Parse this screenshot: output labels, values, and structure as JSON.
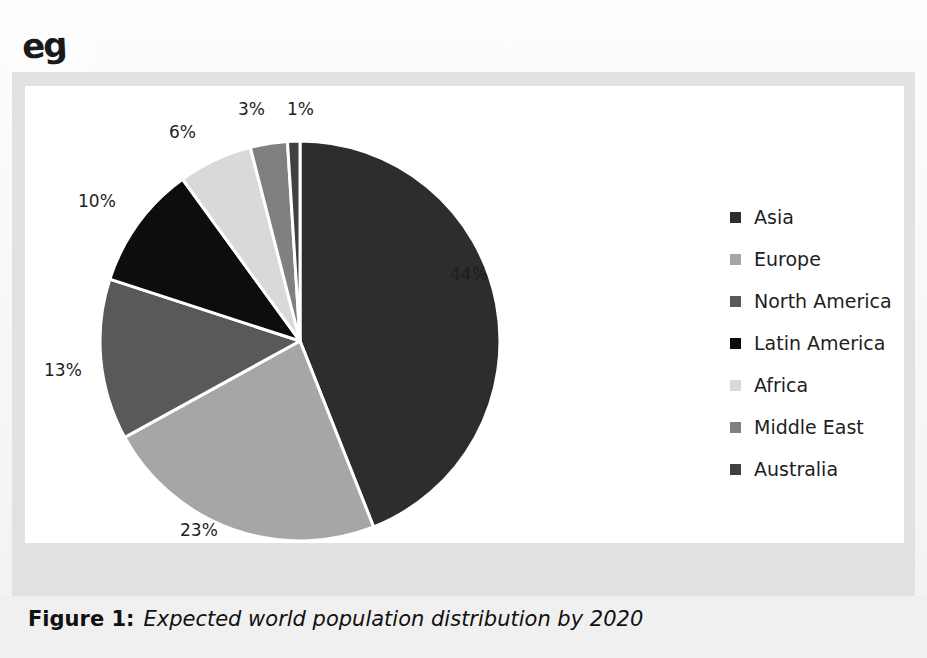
{
  "page": {
    "ghost_watermark": "population",
    "annotation_mark": "eg"
  },
  "caption": {
    "figure_number": "Figure 1:",
    "text": "Expected world population distribution by 2020"
  },
  "legend": {
    "items": [
      {
        "label": "Asia",
        "color": "#2d2d2d"
      },
      {
        "label": "Europe",
        "color": "#a6a6a6"
      },
      {
        "label": "North America",
        "color": "#595959"
      },
      {
        "label": "Latin America",
        "color": "#0d0d0d"
      },
      {
        "label": "Africa",
        "color": "#d9d9d9"
      },
      {
        "label": "Middle East",
        "color": "#808080"
      },
      {
        "label": "Australia",
        "color": "#404040"
      }
    ]
  },
  "labels": [
    {
      "text": "44%"
    },
    {
      "text": "23%"
    },
    {
      "text": "13%"
    },
    {
      "text": "10%"
    },
    {
      "text": "6%"
    },
    {
      "text": "3%"
    },
    {
      "text": "1%"
    }
  ],
  "chart_data": {
    "type": "pie",
    "title": "Expected world population distribution by 2020",
    "xlabel": "",
    "ylabel": "",
    "categories": [
      "Asia",
      "Europe",
      "North America",
      "Latin America",
      "Africa",
      "Middle East",
      "Australia"
    ],
    "values": [
      44,
      23,
      13,
      10,
      6,
      3,
      1
    ],
    "value_labels": [
      "44%",
      "23%",
      "13%",
      "10%",
      "6%",
      "3%",
      "1%"
    ],
    "colors": [
      "#2d2d2d",
      "#a6a6a6",
      "#595959",
      "#0d0d0d",
      "#d9d9d9",
      "#808080",
      "#404040"
    ],
    "units": "percent",
    "start_angle_deg": 0,
    "direction": "clockwise",
    "slice_separator_color": "#ffffff",
    "legend_position": "right",
    "grid": false,
    "labels_outside": true
  }
}
